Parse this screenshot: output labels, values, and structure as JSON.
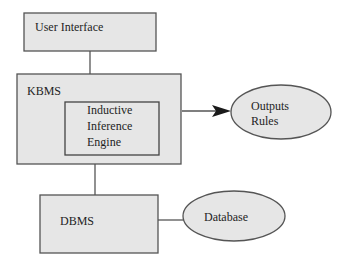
{
  "diagram": {
    "nodes": {
      "user_interface": {
        "label": "User Interface",
        "shape": "rect"
      },
      "kbms": {
        "label": "KBMS",
        "shape": "rect"
      },
      "inference_engine": {
        "lines": [
          "Inductive",
          "Inference",
          "Engine"
        ],
        "shape": "rect"
      },
      "outputs_rules": {
        "lines": [
          "Outputs",
          "Rules"
        ],
        "shape": "ellipse"
      },
      "dbms": {
        "label": "DBMS",
        "shape": "rect"
      },
      "database": {
        "label": "Database",
        "shape": "ellipse"
      }
    },
    "edges": [
      {
        "from": "user_interface",
        "to": "kbms",
        "arrow": false
      },
      {
        "from": "kbms",
        "to": "outputs_rules",
        "arrow": true
      },
      {
        "from": "kbms",
        "to": "dbms",
        "arrow": false
      },
      {
        "from": "dbms",
        "to": "database",
        "arrow": false
      }
    ],
    "colors": {
      "fill": "#e6e6e6",
      "stroke": "#555555",
      "background": "#ffffff"
    }
  }
}
